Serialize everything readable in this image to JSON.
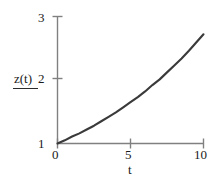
{
  "chart_data": {
    "type": "line",
    "title": "",
    "xlabel": "t",
    "ylabel": "z(t)",
    "xlim": [
      0,
      10
    ],
    "ylim": [
      1,
      3
    ],
    "grid": false,
    "legend": null,
    "xticks": [
      "0",
      "5",
      "10"
    ],
    "xtick_values": [
      0,
      5,
      10
    ],
    "yticks": [
      "1",
      "2",
      "3"
    ],
    "ytick_values": [
      1,
      2,
      3
    ],
    "series": [
      {
        "name": "z(t)",
        "color": "#3a3a3a",
        "x": [
          0,
          0.5,
          1,
          1.5,
          2,
          2.5,
          3,
          3.5,
          4,
          4.5,
          5,
          5.5,
          6,
          6.5,
          7,
          7.5,
          8,
          8.5,
          9,
          9.5,
          10
        ],
        "values": [
          1.0,
          1.05,
          1.11,
          1.16,
          1.22,
          1.28,
          1.35,
          1.42,
          1.49,
          1.57,
          1.65,
          1.73,
          1.82,
          1.92,
          2.01,
          2.12,
          2.23,
          2.34,
          2.46,
          2.59,
          2.72
        ]
      }
    ]
  },
  "axes": {
    "y_ticks": [
      {
        "label": "3"
      },
      {
        "label": "2"
      },
      {
        "label": "1"
      }
    ],
    "x_ticks": [
      {
        "label": "0"
      },
      {
        "label": "5"
      },
      {
        "label": "10"
      }
    ],
    "y_title": "z(t)",
    "x_title": "t"
  },
  "colors": {
    "background": "#ffffff",
    "axis": "#808080",
    "curve": "#3a3a3a",
    "text": "#1a1a1a"
  }
}
